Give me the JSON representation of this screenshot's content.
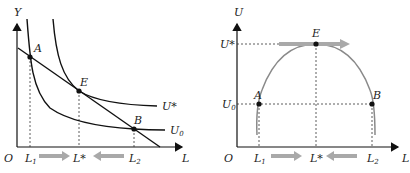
{
  "left_panel": {
    "y_axis_label": "Y",
    "x_axis_label": "L",
    "origin_label": "O",
    "points": {
      "A": "A",
      "E": "E",
      "B": "B"
    },
    "curve_labels": {
      "u_star": "U*",
      "u0_main": "U",
      "u0_sub": "0"
    },
    "ticks": {
      "l1_main": "L",
      "l1_sub": "1",
      "lstar": "L*",
      "l2_main": "L",
      "l2_sub": "2"
    }
  },
  "right_panel": {
    "y_axis_label": "U",
    "x_axis_label": "L",
    "origin_label": "O",
    "points": {
      "A": "A",
      "E": "E",
      "B": "B"
    },
    "y_ticks": {
      "u_star": "U*",
      "u0_main": "U",
      "u0_sub": "0"
    },
    "ticks": {
      "l1_main": "L",
      "l1_sub": "1",
      "lstar": "L*",
      "l2_main": "L",
      "l2_sub": "2"
    }
  },
  "colors": {
    "curve": "#1a1a1a",
    "arch": "#8a8a8a",
    "arrow": "#a9a9a9",
    "dashed": "#333333"
  }
}
